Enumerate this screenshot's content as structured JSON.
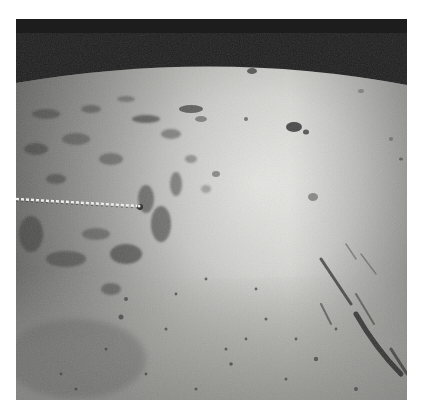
{
  "image": {
    "subject": "oblique aerial photograph of lunar surface with curved horizon",
    "palette": {
      "sky": "#1c1c1c",
      "highlands_bright": "#e8e8e6",
      "surface_mid": "#b9b9b6",
      "mare_gray": "#9a9a97",
      "shadow": "#2a2a2a"
    },
    "features": [
      {
        "name": "horizon",
        "shape": "arc"
      },
      {
        "name": "crater-chain",
        "shape": "dotted line from left edge toward center"
      },
      {
        "name": "rugged-terrain",
        "region": "left"
      },
      {
        "name": "bright-plain",
        "region": "upper-center/right"
      },
      {
        "name": "rilles",
        "region": "lower-right"
      },
      {
        "name": "mare-plain",
        "region": "bottom"
      }
    ]
  }
}
